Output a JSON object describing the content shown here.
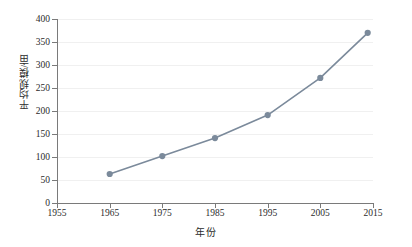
{
  "chart_data": {
    "type": "line",
    "title": "",
    "subtitle": "",
    "xlabel": "年份",
    "ylabel": "平均规模/亩",
    "xlim": [
      1955,
      2015
    ],
    "ylim": [
      0,
      400
    ],
    "xticks": [
      1955,
      1965,
      1975,
      1985,
      1995,
      2005,
      2015
    ],
    "xtick_labels": [
      "1955",
      "1965",
      "1975",
      "1985",
      "1995",
      "2005",
      "2015"
    ],
    "yticks": [
      0,
      50,
      100,
      150,
      200,
      250,
      300,
      350,
      400
    ],
    "ytick_labels": [
      "0",
      "50",
      "100",
      "150",
      "200",
      "250",
      "300",
      "350",
      "400"
    ],
    "grid": "horizontal-faint",
    "legend": "none",
    "series": [
      {
        "name": "平均规模",
        "color": "#7b8a9b",
        "marker": "circle",
        "x": [
          1965,
          1975,
          1985,
          1995,
          2005,
          2014
        ],
        "values": [
          63,
          102,
          141,
          191,
          272,
          370
        ],
        "points": [
          {
            "x": 1965,
            "y": 63
          },
          {
            "x": 1975,
            "y": 102
          },
          {
            "x": 1985,
            "y": 141
          },
          {
            "x": 1995,
            "y": 191
          },
          {
            "x": 2005,
            "y": 272
          },
          {
            "x": 2014,
            "y": 370
          }
        ]
      }
    ],
    "annotations": []
  },
  "colors": {
    "series": "#7b8a9b",
    "axis": "#7a7a7a",
    "grid": "#f0f0f0",
    "text": "#2b2b2b",
    "background": "#ffffff"
  }
}
